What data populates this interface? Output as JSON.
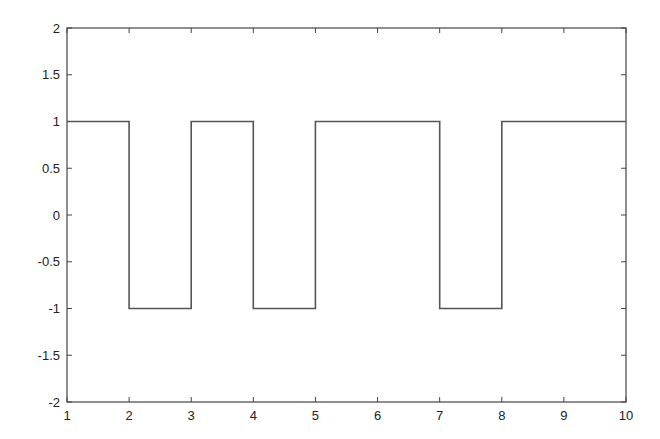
{
  "chart_data": {
    "type": "line",
    "title": "",
    "xlabel": "",
    "ylabel": "",
    "xlim": [
      1,
      10
    ],
    "ylim": [
      -2,
      2
    ],
    "grid": false,
    "legend": null,
    "x_ticks": [
      "1",
      "2",
      "3",
      "4",
      "5",
      "6",
      "7",
      "8",
      "9",
      "10"
    ],
    "y_ticks": [
      "2",
      "1.5",
      "1",
      "0.5",
      "0",
      "-0.5",
      "-1",
      "-1.5",
      "-2"
    ],
    "series": [
      {
        "name": "square wave",
        "step": true,
        "color": "#555555",
        "x": [
          1,
          2,
          2,
          3,
          3,
          4,
          4,
          5,
          5,
          7,
          7,
          8,
          8,
          10
        ],
        "y": [
          1,
          1,
          -1,
          -1,
          1,
          1,
          -1,
          -1,
          1,
          1,
          -1,
          -1,
          1,
          1
        ]
      }
    ]
  },
  "colors": {
    "axis": "#444444",
    "line": "#555555",
    "background": "#ffffff"
  }
}
